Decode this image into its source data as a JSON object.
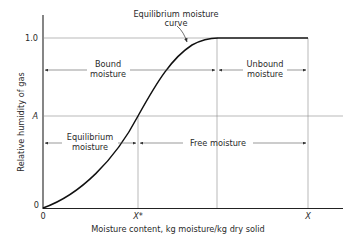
{
  "diagram": {
    "title_annotation": {
      "line1": "Equilibrium moisture",
      "line2": "curve"
    },
    "y_axis": {
      "label": "Relative humidity of gas",
      "ticks": {
        "top": "1.0",
        "mid": "A",
        "bottom": "0"
      }
    },
    "x_axis": {
      "label": "Moisture content, kg moisture/kg dry solid",
      "ticks": {
        "origin": "0",
        "x_star": "X*",
        "x": "X"
      }
    },
    "regions": {
      "bound": {
        "line1": "Bound",
        "line2": "moisture"
      },
      "unbound": {
        "line1": "Unbound",
        "line2": "moisture"
      },
      "equilibrium": {
        "line1": "Equilibrium",
        "line2": "moisture"
      },
      "free": {
        "label": "Free moisture"
      }
    },
    "colors": {
      "ink": "#1a1a1a",
      "grid": "#8c8c8c",
      "background": "#ffffff"
    }
  }
}
